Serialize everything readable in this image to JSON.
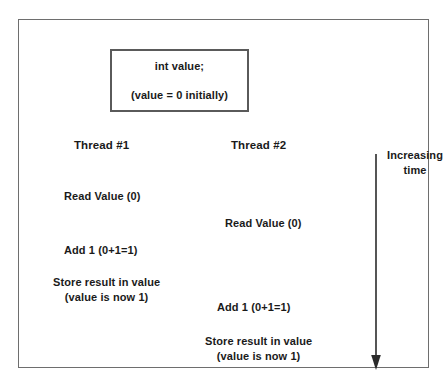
{
  "figure": {
    "border_color": "#6e6e6e",
    "text_color": "#1a1a1a",
    "background": "#ffffff"
  },
  "shared_variable_box": {
    "declaration": "int value;",
    "initial_note": "(value = 0 initially)",
    "border_color": "#5a5a5a"
  },
  "threads": [
    {
      "header": "Thread #1",
      "steps": [
        {
          "line1": "Read Value (0)",
          "line2": ""
        },
        {
          "line1": "Add 1 (0+1=1)",
          "line2": ""
        },
        {
          "line1": "Store result in value",
          "line2": "(value is now 1)"
        }
      ]
    },
    {
      "header": "Thread #2",
      "steps": [
        {
          "line1": "Read Value (0)",
          "line2": ""
        },
        {
          "line1": "Add 1 (0+1=1)",
          "line2": ""
        },
        {
          "line1": "Store result in value",
          "line2": "(value is now 1)"
        }
      ]
    }
  ],
  "time_axis": {
    "label_line1": "Increasing",
    "label_line2": "time",
    "direction": "downward",
    "arrow_color": "#2b2b2b"
  }
}
